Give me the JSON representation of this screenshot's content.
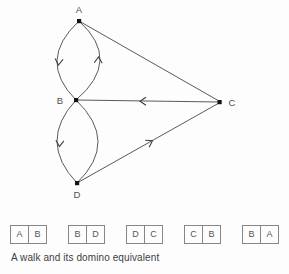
{
  "figure": {
    "caption": "A walk and its domino equivalent",
    "colors": {
      "background": "#fdfdfd",
      "edge_line": "#5a5a5a",
      "arrowhead": "#3f3f3f",
      "vertex_dot": "#141414",
      "vertex_label": "#4e4e4e",
      "domino_border": "#878787",
      "domino_letter": "#555555",
      "caption_text": "#3d3d3d"
    },
    "diagram": {
      "type": "directed-multigraph-walk",
      "vertices": [
        {
          "id": "A",
          "label": "A"
        },
        {
          "id": "B",
          "label": "B"
        },
        {
          "id": "C",
          "label": "C"
        },
        {
          "id": "D",
          "label": "D"
        }
      ],
      "edges": [
        {
          "between": [
            "A",
            "B"
          ],
          "style": "curve-left",
          "arrow_direction": "A to B"
        },
        {
          "between": [
            "A",
            "B"
          ],
          "style": "curve-right",
          "arrow_direction": "B to A"
        },
        {
          "between": [
            "B",
            "D"
          ],
          "style": "curve-left",
          "arrow_direction": "B to D"
        },
        {
          "between": [
            "B",
            "D"
          ],
          "style": "curve-right",
          "arrow_direction": "none"
        },
        {
          "between": [
            "A",
            "C"
          ],
          "style": "straight",
          "arrow_direction": "none"
        },
        {
          "between": [
            "C",
            "B"
          ],
          "style": "straight",
          "arrow_direction": "C to B"
        },
        {
          "between": [
            "D",
            "C"
          ],
          "style": "straight",
          "arrow_direction": "D to C"
        }
      ],
      "walk": [
        "A",
        "B",
        "D",
        "C",
        "B",
        "A"
      ]
    },
    "dominoes": [
      {
        "left": "A",
        "right": "B"
      },
      {
        "left": "B",
        "right": "D"
      },
      {
        "left": "D",
        "right": "C"
      },
      {
        "left": "C",
        "right": "B"
      },
      {
        "left": "B",
        "right": "A"
      }
    ]
  }
}
